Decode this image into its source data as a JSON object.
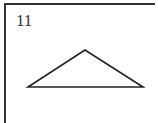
{
  "problem": {
    "number": "11",
    "figure": {
      "shape": "triangle",
      "type": "obtuse-isosceles",
      "vertices": {
        "apex": [
          85,
          50
        ],
        "base_left": [
          28,
          87
        ],
        "base_right": [
          143,
          87
        ]
      },
      "stroke_color": "#222222"
    }
  }
}
